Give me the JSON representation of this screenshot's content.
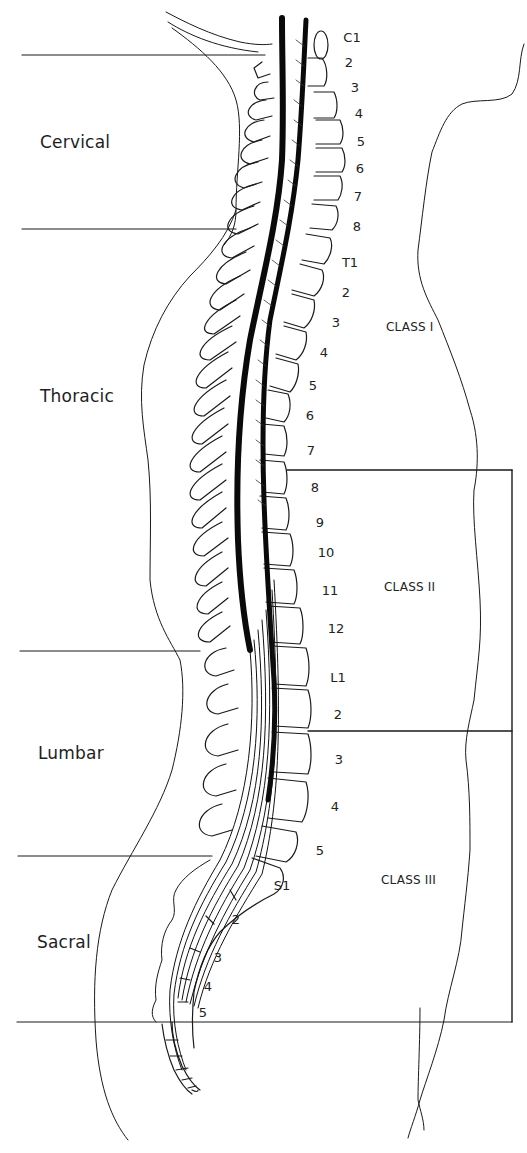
{
  "figure": {
    "type": "sagittal spinal cord anatomy diagram",
    "background": "#ffffff",
    "line_color": "#1a1a1a"
  },
  "regions": [
    {
      "label": "Cervical",
      "x": 40,
      "y": 132
    },
    {
      "label": "Thoracic",
      "x": 40,
      "y": 386
    },
    {
      "label": "Lumbar",
      "x": 38,
      "y": 743
    },
    {
      "label": "Sacral",
      "x": 37,
      "y": 932
    }
  ],
  "region_dividers": [
    {
      "y": 55,
      "x1": 22,
      "x2": 265
    },
    {
      "y": 229,
      "x1": 22,
      "x2": 236
    },
    {
      "y": 651,
      "x1": 20,
      "x2": 200
    },
    {
      "y": 856,
      "x1": 18,
      "x2": 212
    },
    {
      "y": 1022,
      "x1": 17,
      "x2": 512
    }
  ],
  "vertebrae": [
    {
      "label": "C1",
      "x": 352,
      "y": 30
    },
    {
      "label": "2",
      "x": 349,
      "y": 55
    },
    {
      "label": "3",
      "x": 355,
      "y": 80
    },
    {
      "label": "4",
      "x": 359,
      "y": 106
    },
    {
      "label": "5",
      "x": 361,
      "y": 134
    },
    {
      "label": "6",
      "x": 360,
      "y": 161
    },
    {
      "label": "7",
      "x": 358,
      "y": 189
    },
    {
      "label": "8",
      "x": 357,
      "y": 219
    },
    {
      "label": "T1",
      "x": 350,
      "y": 255
    },
    {
      "label": "2",
      "x": 346,
      "y": 285
    },
    {
      "label": "3",
      "x": 336,
      "y": 315
    },
    {
      "label": "4",
      "x": 324,
      "y": 345
    },
    {
      "label": "5",
      "x": 313,
      "y": 378
    },
    {
      "label": "6",
      "x": 310,
      "y": 408
    },
    {
      "label": "7",
      "x": 311,
      "y": 443
    },
    {
      "label": "8",
      "x": 315,
      "y": 480
    },
    {
      "label": "9",
      "x": 320,
      "y": 515
    },
    {
      "label": "10",
      "x": 326,
      "y": 545
    },
    {
      "label": "11",
      "x": 330,
      "y": 583
    },
    {
      "label": "12",
      "x": 336,
      "y": 621
    },
    {
      "label": "L1",
      "x": 338,
      "y": 670
    },
    {
      "label": "2",
      "x": 338,
      "y": 707
    },
    {
      "label": "3",
      "x": 339,
      "y": 752
    },
    {
      "label": "4",
      "x": 335,
      "y": 799
    },
    {
      "label": "5",
      "x": 320,
      "y": 843
    },
    {
      "label": "S1",
      "x": 282,
      "y": 878
    },
    {
      "label": "2",
      "x": 236,
      "y": 912
    },
    {
      "label": "3",
      "x": 218,
      "y": 950
    },
    {
      "label": "4",
      "x": 208,
      "y": 979
    },
    {
      "label": "5",
      "x": 203,
      "y": 1005
    }
  ],
  "classes": [
    {
      "label": "CLASS I",
      "x": 386,
      "y": 320
    },
    {
      "label": "CLASS II",
      "x": 384,
      "y": 580
    },
    {
      "label": "CLASS III",
      "x": 381,
      "y": 873
    }
  ],
  "class_boxes": {
    "top_line": {
      "y": 470,
      "x1": 287,
      "x2": 512
    },
    "mid_line": {
      "y": 731,
      "x1": 308,
      "x2": 512
    },
    "right_edge": {
      "x": 512,
      "y1": 470,
      "y2": 1022
    }
  }
}
